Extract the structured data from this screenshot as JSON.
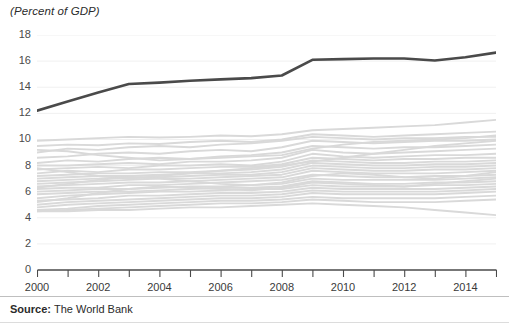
{
  "chart_data": {
    "type": "line",
    "title": "(Percent of GDP)",
    "xlabel": "",
    "ylabel": "",
    "xlim": [
      2000,
      2015
    ],
    "ylim": [
      0,
      18
    ],
    "grid": true,
    "grid_axis": "y",
    "legend_position": "none",
    "x": [
      2000,
      2001,
      2002,
      2003,
      2004,
      2005,
      2006,
      2007,
      2008,
      2009,
      2010,
      2011,
      2012,
      2013,
      2014,
      2015
    ],
    "y_ticks": [
      0,
      2,
      4,
      6,
      8,
      10,
      12,
      14,
      16,
      18
    ],
    "x_ticks": [
      2000,
      2001,
      2002,
      2003,
      2004,
      2005,
      2006,
      2007,
      2008,
      2009,
      2010,
      2011,
      2012,
      2013,
      2014,
      2015
    ],
    "x_tick_labels_shown": [
      2000,
      2002,
      2004,
      2006,
      2008,
      2010,
      2012,
      2014
    ],
    "colors": {
      "highlight_line": "#4a4a4a",
      "background_lines": "#d9d9d9",
      "gridline": "#f0f0f0",
      "axis": "#4a4a4a",
      "text": "#2b2b2b"
    },
    "series": [
      {
        "name": "highlighted",
        "emphasis": "highlighted",
        "color": "#4a4a4a",
        "values": [
          12.2,
          12.9,
          13.6,
          14.25,
          14.35,
          14.5,
          14.6,
          14.7,
          14.9,
          16.1,
          16.15,
          16.2,
          16.2,
          16.05,
          16.3,
          16.65
        ]
      },
      {
        "name": "bg-1",
        "emphasis": "background",
        "color": "#d9d9d9",
        "values": [
          9.9,
          10.0,
          10.1,
          10.2,
          10.15,
          10.2,
          10.3,
          10.25,
          10.4,
          10.7,
          10.8,
          10.9,
          11.0,
          11.1,
          11.3,
          11.5
        ]
      },
      {
        "name": "bg-2",
        "emphasis": "background",
        "color": "#d9d9d9",
        "values": [
          9.5,
          9.6,
          9.55,
          9.7,
          9.65,
          9.8,
          9.9,
          9.8,
          10.0,
          10.4,
          10.3,
          10.2,
          10.3,
          10.4,
          10.5,
          10.6
        ]
      },
      {
        "name": "bg-3",
        "emphasis": "background",
        "color": "#d9d9d9",
        "values": [
          9.0,
          9.3,
          9.2,
          9.4,
          9.5,
          9.4,
          9.6,
          9.7,
          9.9,
          10.2,
          10.1,
          10.0,
          10.1,
          10.1,
          10.2,
          10.2
        ]
      },
      {
        "name": "bg-4",
        "emphasis": "background",
        "color": "#d9d9d9",
        "values": [
          8.6,
          8.7,
          8.9,
          9.0,
          8.9,
          9.1,
          9.2,
          9.1,
          9.4,
          9.9,
          9.8,
          9.7,
          9.8,
          9.9,
          9.9,
          10.0
        ]
      },
      {
        "name": "bg-5",
        "emphasis": "background",
        "color": "#d9d9d9",
        "values": [
          8.2,
          8.4,
          8.3,
          8.5,
          8.6,
          8.5,
          8.7,
          8.8,
          9.0,
          9.5,
          9.4,
          9.3,
          9.4,
          9.4,
          9.5,
          9.6
        ]
      },
      {
        "name": "bg-6",
        "emphasis": "background",
        "color": "#d9d9d9",
        "values": [
          8.0,
          8.0,
          8.1,
          8.2,
          8.1,
          8.3,
          8.3,
          8.4,
          8.6,
          9.2,
          9.0,
          8.9,
          9.0,
          9.1,
          9.2,
          9.3
        ]
      },
      {
        "name": "bg-7",
        "emphasis": "background",
        "color": "#d9d9d9",
        "values": [
          7.7,
          7.8,
          7.9,
          7.8,
          8.0,
          8.0,
          8.1,
          8.0,
          8.3,
          8.9,
          8.7,
          8.6,
          8.7,
          8.8,
          8.8,
          8.9
        ]
      },
      {
        "name": "bg-8",
        "emphasis": "background",
        "color": "#d9d9d9",
        "values": [
          7.4,
          7.6,
          7.5,
          7.7,
          7.7,
          7.8,
          7.9,
          7.9,
          8.1,
          8.6,
          8.5,
          8.4,
          8.5,
          8.5,
          8.6,
          8.6
        ]
      },
      {
        "name": "bg-9",
        "emphasis": "background",
        "color": "#d9d9d9",
        "values": [
          7.2,
          7.3,
          7.4,
          7.4,
          7.5,
          7.5,
          7.6,
          7.7,
          7.9,
          8.4,
          8.3,
          8.2,
          8.2,
          8.3,
          8.3,
          8.4
        ]
      },
      {
        "name": "bg-10",
        "emphasis": "background",
        "color": "#d9d9d9",
        "values": [
          7.0,
          7.1,
          7.2,
          7.2,
          7.3,
          7.4,
          7.4,
          7.5,
          7.7,
          8.2,
          8.1,
          8.0,
          8.0,
          8.1,
          8.1,
          8.2
        ]
      },
      {
        "name": "bg-11",
        "emphasis": "background",
        "color": "#d9d9d9",
        "values": [
          6.8,
          6.9,
          7.0,
          7.1,
          7.1,
          7.2,
          7.3,
          7.3,
          7.5,
          8.0,
          7.9,
          7.8,
          7.8,
          7.9,
          7.9,
          8.0
        ]
      },
      {
        "name": "bg-12",
        "emphasis": "background",
        "color": "#d9d9d9",
        "values": [
          6.6,
          6.7,
          6.8,
          6.9,
          7.0,
          7.0,
          7.1,
          7.2,
          7.3,
          7.8,
          7.7,
          7.6,
          7.6,
          7.7,
          7.7,
          7.8
        ]
      },
      {
        "name": "bg-13",
        "emphasis": "background",
        "color": "#d9d9d9",
        "values": [
          6.4,
          6.5,
          6.6,
          6.7,
          6.7,
          6.8,
          6.9,
          7.0,
          7.1,
          7.6,
          7.5,
          7.4,
          7.4,
          7.4,
          7.5,
          7.6
        ]
      },
      {
        "name": "bg-14",
        "emphasis": "background",
        "color": "#d9d9d9",
        "values": [
          6.2,
          6.3,
          6.3,
          6.5,
          6.5,
          6.6,
          6.7,
          6.8,
          6.9,
          7.3,
          7.2,
          7.1,
          7.1,
          7.2,
          7.2,
          7.3
        ]
      },
      {
        "name": "bg-15",
        "emphasis": "background",
        "color": "#d9d9d9",
        "values": [
          6.0,
          6.1,
          6.2,
          6.2,
          6.3,
          6.4,
          6.4,
          6.5,
          6.6,
          7.0,
          6.9,
          6.9,
          6.9,
          6.9,
          7.0,
          7.1
        ]
      },
      {
        "name": "bg-16",
        "emphasis": "background",
        "color": "#d9d9d9",
        "values": [
          5.8,
          5.9,
          6.0,
          6.0,
          6.1,
          6.2,
          6.3,
          6.3,
          6.4,
          6.8,
          6.7,
          6.6,
          6.6,
          6.7,
          6.7,
          6.8
        ]
      },
      {
        "name": "bg-17",
        "emphasis": "background",
        "color": "#d9d9d9",
        "values": [
          5.5,
          5.7,
          5.8,
          5.9,
          6.0,
          6.0,
          6.1,
          6.2,
          6.2,
          6.5,
          6.4,
          6.4,
          6.4,
          6.5,
          6.5,
          6.6
        ]
      },
      {
        "name": "bg-18",
        "emphasis": "background",
        "color": "#d9d9d9",
        "values": [
          5.3,
          5.4,
          5.5,
          5.7,
          5.7,
          5.8,
          5.9,
          5.9,
          6.0,
          6.3,
          6.2,
          6.2,
          6.2,
          6.2,
          6.3,
          6.4
        ]
      },
      {
        "name": "bg-19",
        "emphasis": "background",
        "color": "#d9d9d9",
        "values": [
          5.0,
          5.2,
          5.3,
          5.4,
          5.5,
          5.6,
          5.7,
          5.7,
          5.8,
          6.1,
          6.0,
          6.0,
          6.0,
          6.0,
          6.1,
          6.2
        ]
      },
      {
        "name": "bg-20",
        "emphasis": "background",
        "color": "#d9d9d9",
        "values": [
          4.8,
          5.0,
          5.1,
          5.2,
          5.3,
          5.4,
          5.5,
          5.5,
          5.6,
          5.9,
          5.8,
          5.8,
          5.8,
          5.8,
          5.9,
          6.0
        ]
      },
      {
        "name": "bg-21",
        "emphasis": "background",
        "color": "#d9d9d9",
        "values": [
          4.6,
          4.7,
          4.9,
          5.0,
          5.1,
          5.2,
          5.3,
          5.3,
          5.4,
          5.6,
          5.5,
          5.5,
          5.5,
          5.5,
          5.6,
          5.7
        ]
      },
      {
        "name": "bg-22",
        "emphasis": "background",
        "color": "#d9d9d9",
        "values": [
          4.5,
          4.6,
          4.7,
          4.8,
          4.9,
          5.0,
          5.1,
          5.1,
          5.2,
          5.4,
          5.3,
          5.2,
          5.2,
          5.2,
          5.3,
          5.4
        ]
      },
      {
        "name": "bg-23",
        "emphasis": "background",
        "color": "#d9d9d9",
        "values": [
          4.5,
          4.5,
          4.6,
          4.6,
          4.7,
          4.8,
          4.8,
          4.9,
          5.0,
          5.1,
          5.0,
          4.9,
          4.8,
          4.6,
          4.4,
          4.2
        ]
      },
      {
        "name": "bg-24",
        "emphasis": "background",
        "color": "#d9d9d9",
        "values": [
          9.2,
          9.1,
          8.8,
          8.6,
          8.4,
          8.5,
          8.6,
          8.7,
          8.8,
          9.3,
          9.6,
          9.8,
          9.9,
          10.0,
          10.1,
          10.3
        ]
      },
      {
        "name": "bg-25",
        "emphasis": "background",
        "color": "#d9d9d9",
        "values": [
          7.8,
          7.5,
          7.2,
          7.0,
          7.2,
          7.4,
          7.6,
          7.8,
          8.0,
          8.3,
          8.6,
          8.9,
          9.2,
          9.5,
          9.7,
          9.9
        ]
      },
      {
        "name": "bg-26",
        "emphasis": "background",
        "color": "#d9d9d9",
        "values": [
          6.3,
          6.6,
          6.9,
          7.1,
          7.0,
          6.8,
          6.6,
          6.5,
          6.7,
          7.2,
          7.4,
          7.3,
          7.1,
          7.0,
          7.2,
          7.5
        ]
      },
      {
        "name": "bg-27",
        "emphasis": "background",
        "color": "#d9d9d9",
        "values": [
          5.2,
          5.5,
          5.9,
          6.2,
          6.4,
          6.3,
          6.2,
          6.1,
          6.3,
          6.7,
          6.6,
          6.5,
          6.4,
          6.6,
          6.8,
          7.0
        ]
      }
    ]
  },
  "source": {
    "label": "Source:",
    "text": "The World Bank"
  }
}
